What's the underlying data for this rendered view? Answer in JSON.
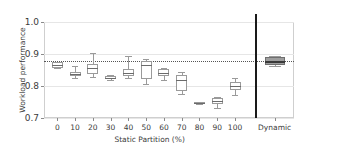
{
  "chart_data": {
    "type": "table",
    "plot_kind": "boxplot",
    "title": "",
    "xlabel": "Static Partition (%)",
    "ylabel": "Workload performance",
    "ylim": [
      0.7,
      1.0
    ],
    "ytick_labels": [
      "0.7",
      "0.8",
      "0.9",
      "1.0"
    ],
    "ytick_values": [
      0.7,
      0.8,
      0.9,
      1.0
    ],
    "grid": true,
    "legend": "none",
    "reference_line": {
      "value": 0.877,
      "style": "dotted",
      "orientation": "horizontal",
      "label": ""
    },
    "separator": {
      "after_category": "100",
      "style": "solid-vertical-black"
    },
    "categories": [
      "0",
      "10",
      "20",
      "30",
      "40",
      "50",
      "60",
      "70",
      "80",
      "90",
      "100",
      "Dynamic"
    ],
    "boxes": [
      {
        "category": "0",
        "whisker_low": 0.855,
        "q1": 0.856,
        "median": 0.866,
        "q3": 0.874,
        "whisker_high": 0.875,
        "fill": "white"
      },
      {
        "category": "10",
        "whisker_low": 0.826,
        "q1": 0.831,
        "median": 0.838,
        "q3": 0.845,
        "whisker_high": 0.861,
        "fill": "white"
      },
      {
        "category": "20",
        "whisker_low": 0.828,
        "q1": 0.836,
        "median": 0.855,
        "q3": 0.869,
        "whisker_high": 0.903,
        "fill": "white"
      },
      {
        "category": "30",
        "whisker_low": 0.818,
        "q1": 0.821,
        "median": 0.826,
        "q3": 0.831,
        "whisker_high": 0.834,
        "fill": "white"
      },
      {
        "category": "40",
        "whisker_low": 0.824,
        "q1": 0.83,
        "median": 0.841,
        "q3": 0.853,
        "whisker_high": 0.893,
        "fill": "white"
      },
      {
        "category": "50",
        "whisker_low": 0.806,
        "q1": 0.822,
        "median": 0.866,
        "q3": 0.879,
        "whisker_high": 0.884,
        "fill": "white"
      },
      {
        "category": "60",
        "whisker_low": 0.82,
        "q1": 0.83,
        "median": 0.84,
        "q3": 0.852,
        "whisker_high": 0.855,
        "fill": "white"
      },
      {
        "category": "70",
        "whisker_low": 0.776,
        "q1": 0.784,
        "median": 0.82,
        "q3": 0.833,
        "whisker_high": 0.845,
        "fill": "white"
      },
      {
        "category": "80",
        "whisker_low": 0.745,
        "q1": 0.746,
        "median": 0.748,
        "q3": 0.75,
        "whisker_high": 0.751,
        "fill": "white"
      },
      {
        "category": "90",
        "whisker_low": 0.73,
        "q1": 0.744,
        "median": 0.753,
        "q3": 0.763,
        "whisker_high": 0.766,
        "fill": "white"
      },
      {
        "category": "100",
        "whisker_low": 0.772,
        "q1": 0.789,
        "median": 0.801,
        "q3": 0.811,
        "whisker_high": 0.826,
        "fill": "white"
      },
      {
        "category": "Dynamic",
        "whisker_low": 0.862,
        "q1": 0.866,
        "median": 0.877,
        "q3": 0.89,
        "whisker_high": 0.893,
        "fill": "gray"
      }
    ]
  },
  "colors": {
    "box_edge": "#9a9a9a",
    "box_face": "#ffffff",
    "dynamic_face": "#9e9e9e",
    "median": "#6b6b6b",
    "reference_line": "#555555",
    "separator": "#1a1a1a",
    "grid": "#e6e6e6",
    "frame": "#cfcfcf",
    "text": "#3b3b3b",
    "background": "#ffffff"
  }
}
